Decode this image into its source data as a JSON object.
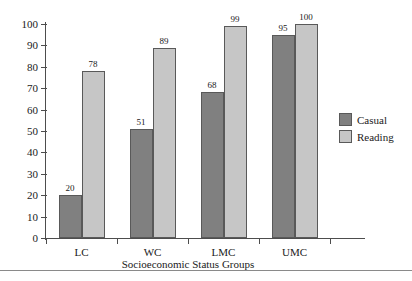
{
  "chart_data": {
    "type": "bar",
    "title": "",
    "xlabel": "Socioeconomic Status Groups",
    "ylabel": "",
    "categories": [
      "LC",
      "WC",
      "LMC",
      "UMC"
    ],
    "series": [
      {
        "name": "Casual",
        "color": "#808080",
        "values": [
          20,
          51,
          68,
          95
        ]
      },
      {
        "name": "Reading",
        "color": "#c6c6c6",
        "values": [
          78,
          89,
          99,
          100
        ]
      }
    ],
    "ylim": [
      0,
      100
    ],
    "ytick_labels": [
      "100",
      "90",
      "80",
      "70",
      "60",
      "50",
      "40",
      "30",
      "20",
      "10",
      "0"
    ],
    "ytick_values": [
      100,
      90,
      80,
      70,
      60,
      50,
      40,
      30,
      20,
      10,
      0
    ],
    "grid": false,
    "legend_position": "right",
    "data_labels": [
      {
        "category": "LC",
        "series": "Casual",
        "value": "20"
      },
      {
        "category": "LC",
        "series": "Reading",
        "value": "78"
      },
      {
        "category": "WC",
        "series": "Casual",
        "value": "51"
      },
      {
        "category": "WC",
        "series": "Reading",
        "value": "89"
      },
      {
        "category": "LMC",
        "series": "Casual",
        "value": "68"
      },
      {
        "category": "LMC",
        "series": "Reading",
        "value": "99"
      },
      {
        "category": "UMC",
        "series": "Casual",
        "value": "95"
      },
      {
        "category": "UMC",
        "series": "Reading",
        "value": "100"
      }
    ]
  },
  "legend": {
    "items": [
      {
        "label": "Casual"
      },
      {
        "label": "Reading"
      }
    ]
  }
}
